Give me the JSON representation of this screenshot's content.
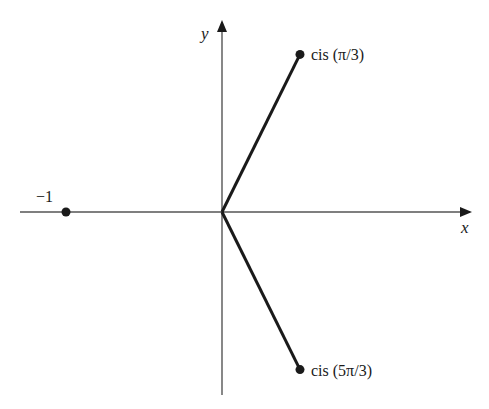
{
  "diagram": {
    "type": "complex-plane",
    "axes": {
      "x_label": "x",
      "y_label": "y"
    },
    "points": [
      {
        "id": "cis-pi-3",
        "label": "cis (π/3)",
        "re": 0.5,
        "im": 0.866,
        "connected_to_origin": true
      },
      {
        "id": "cis-5pi-3",
        "label": "cis (5π/3)",
        "re": 0.5,
        "im": -0.866,
        "connected_to_origin": true
      },
      {
        "id": "minus-one",
        "label": "−1",
        "re": -1,
        "im": 0,
        "connected_to_origin": false
      }
    ],
    "colors": {
      "ink": "#1a1a1a",
      "axis": "#555555",
      "background": "#ffffff"
    }
  }
}
